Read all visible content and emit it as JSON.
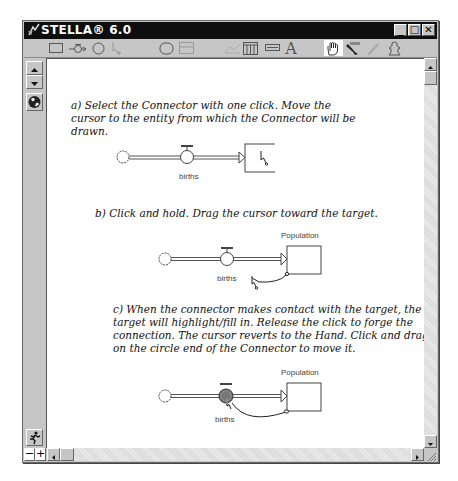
{
  "window": {
    "title": "STELLA® 6.0",
    "controls": {
      "minimize": "_",
      "maximize": "□",
      "close": "✕"
    }
  },
  "toolbar": {
    "tools": [
      {
        "name": "stock-tool",
        "icon": "rectangle-icon"
      },
      {
        "name": "flow-tool",
        "icon": "flow-pipe-icon"
      },
      {
        "name": "converter-tool",
        "icon": "circle-icon"
      },
      {
        "name": "connector-tool",
        "icon": "connector-arrow-icon"
      },
      {
        "name": "decision-process-tool",
        "icon": "rounded-rect-icon"
      },
      {
        "name": "sector-tool",
        "icon": "sector-frame-icon"
      },
      {
        "name": "graph-pad-tool",
        "icon": "graph-icon"
      },
      {
        "name": "table-pad-tool",
        "icon": "table-icon"
      },
      {
        "name": "numeric-display-tool",
        "icon": "numeric-display-icon"
      },
      {
        "name": "text-tool",
        "icon": "text-a-icon",
        "label": "A"
      },
      {
        "name": "hand-tool",
        "icon": "hand-icon",
        "active": true
      },
      {
        "name": "paintbrush-tool",
        "icon": "paintbrush-icon"
      },
      {
        "name": "dynamite-tool",
        "icon": "dynamite-icon"
      },
      {
        "name": "ghost-tool",
        "icon": "ghost-icon"
      }
    ]
  },
  "left_strip": {
    "up_down_arrows": "layer-navigation",
    "map_toggle": "globe-icon",
    "run_button": "runner-icon"
  },
  "zoom_controls": {
    "minus": "−",
    "plus": "+"
  },
  "content": {
    "step_a": {
      "text": "a) Select the Connector with one click. Move the cursor to the entity from which the Connector will be drawn.",
      "lines": [
        "a) Select the Connector with one click. Move the",
        "cursor to the entity from which the Connector will be",
        "drawn."
      ],
      "flow_label": "births",
      "stock_label": ""
    },
    "step_b": {
      "text": "b) Click and hold. Drag the cursor toward the target.",
      "lines": [
        "b) Click and hold. Drag the cursor toward the target."
      ],
      "flow_label": "births",
      "stock_label": "Population"
    },
    "step_c": {
      "text": "c) When the connector makes contact with the target, the target will highlight/fill in. Release the click to forge the connection. The cursor reverts to the Hand. Click and drag on the circle end of the Connector to move it.",
      "lines": [
        "c) When the connector makes contact with the target, the",
        "target will highlight/fill in. Release the click to forge the",
        "connection. The cursor reverts to the Hand. Click and drag",
        "on the circle end of the Connector to move it."
      ],
      "flow_label": "births",
      "stock_label": "Population"
    }
  },
  "colors": {
    "titlebar": "#0e0e0e",
    "chrome": "#c6c6c6",
    "canvas": "#ffffff",
    "text": "#111111"
  }
}
